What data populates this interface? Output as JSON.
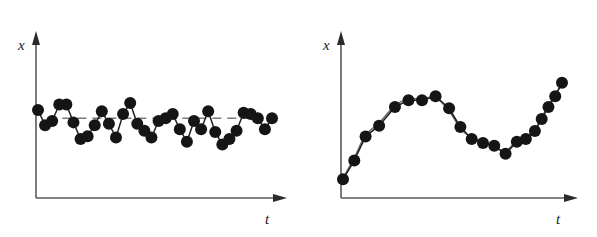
{
  "figure": {
    "background_color": "#ffffff",
    "ink_color": "#1f1f1f",
    "axis_color": "#5a5a5a",
    "trend_color": "#6e6e6e",
    "marker_color": "#151515"
  },
  "chart_data": [
    {
      "type": "line",
      "panel": "left",
      "title": "",
      "subtitle": "",
      "xlabel": "t",
      "ylabel": "x",
      "description": "Stationary series: observations oscillate irregularly about a constant horizontal mean level with no trend.",
      "grid": false,
      "legend": null,
      "axis_arrows": true,
      "xlim": [
        0,
        100
      ],
      "ylim": [
        0,
        100
      ],
      "mean_line": {
        "style": "dashed",
        "value": 52,
        "x_start": 4,
        "x_end": 96,
        "label": ""
      },
      "markers": {
        "shape": "circle",
        "filled": true,
        "size": 6
      },
      "x": [
        1,
        5,
        9,
        13,
        17,
        21,
        25,
        29,
        33,
        37,
        41,
        45,
        49,
        53,
        57,
        61,
        65,
        69,
        73,
        77,
        81,
        85,
        89,
        93,
        97,
        101,
        105,
        109,
        113,
        117,
        121,
        125,
        129,
        133,
        137,
        141,
        145,
        149
      ],
      "values": [
        58,
        47,
        50,
        62,
        62,
        49,
        37,
        39,
        47,
        57,
        48,
        38,
        55,
        63,
        48,
        43,
        38,
        50,
        52,
        55,
        44,
        35,
        50,
        44,
        57,
        42,
        33,
        37,
        43,
        56,
        55,
        52,
        44,
        52
      ],
      "series": [
        {
          "name": "observation",
          "values": [
            58,
            47,
            50,
            62,
            62,
            49,
            37,
            39,
            47,
            57,
            48,
            38,
            55,
            63,
            48,
            43,
            38,
            50,
            52,
            55,
            44,
            35,
            50,
            44,
            57,
            42,
            33,
            37,
            43,
            56,
            55,
            52,
            44,
            52
          ]
        }
      ],
      "n_points": 34
    },
    {
      "type": "line",
      "panel": "right",
      "title": "",
      "subtitle": "",
      "xlabel": "t",
      "ylabel": "x",
      "description": "Non-stationary series: observations rise to a hump, fall to a trough and rise again, tracked by a smooth trend curve.",
      "grid": false,
      "legend": null,
      "axis_arrows": true,
      "xlim": [
        0,
        100
      ],
      "ylim": [
        0,
        100
      ],
      "mean_line": null,
      "markers": {
        "shape": "circle",
        "filled": true,
        "size": 6
      },
      "x": [
        2,
        7,
        12,
        18,
        25,
        31,
        37,
        43,
        49,
        54,
        59,
        64,
        69,
        74,
        79,
        83,
        87,
        90,
        93,
        96,
        99
      ],
      "values": [
        8,
        22,
        40,
        48,
        62,
        67,
        67,
        70,
        61,
        47,
        38,
        35,
        33,
        27,
        36,
        38,
        44,
        53,
        62,
        70,
        80
      ],
      "series": [
        {
          "name": "observation",
          "values": [
            8,
            22,
            40,
            48,
            62,
            67,
            67,
            70,
            61,
            47,
            38,
            35,
            33,
            27,
            36,
            38,
            44,
            53,
            62,
            70,
            80
          ]
        },
        {
          "name": "trend",
          "values": [
            9,
            24,
            41,
            50,
            63,
            68,
            68,
            69,
            59,
            46,
            39,
            36,
            32,
            29,
            37,
            40,
            45,
            54,
            63,
            71,
            80
          ]
        }
      ],
      "n_points": 21
    }
  ],
  "panels": {
    "left": {
      "name": "stationary-series-panel",
      "y_axis_label": "x",
      "x_axis_label": "t"
    },
    "right": {
      "name": "nonstationary-series-panel",
      "y_axis_label": "x",
      "x_axis_label": "t"
    }
  }
}
